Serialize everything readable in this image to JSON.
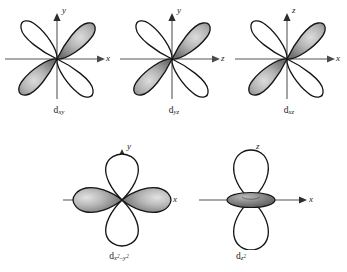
{
  "figure": {
    "background_color": "#ffffff",
    "axis_color": "#8a8a8a",
    "outline_color": "#1a1a1a",
    "lobe_shaded_color": "#9a9a9a",
    "lobe_white_color": "#ffffff",
    "row1": [
      {
        "id": "dxy",
        "label_d": "d",
        "label_sub": "xy",
        "vertical_axis": "y",
        "horizontal_axis": "x",
        "shaded_quadrants": [
          1,
          3
        ],
        "white_quadrants": [
          2,
          4
        ],
        "shape": "four-lobe-diagonal"
      },
      {
        "id": "dyz",
        "label_d": "d",
        "label_sub": "yz",
        "vertical_axis": "y",
        "horizontal_axis": "z",
        "shaded_quadrants": [
          1,
          3
        ],
        "white_quadrants": [
          2,
          4
        ],
        "shape": "four-lobe-diagonal"
      },
      {
        "id": "dxz",
        "label_d": "d",
        "label_sub": "xz",
        "vertical_axis": "z",
        "horizontal_axis": "x",
        "shaded_quadrants": [
          1,
          3
        ],
        "white_quadrants": [
          2,
          4
        ],
        "shape": "four-lobe-diagonal"
      }
    ],
    "row2": [
      {
        "id": "dx2-y2",
        "label_d": "d",
        "label_sub_main": "x",
        "label_sub_sup1": "2",
        "label_sub_minus": "–y",
        "label_sub_sup2": "2",
        "vertical_axis": "y",
        "horizontal_axis": "x",
        "shaded_axis": "x",
        "white_axis": "y",
        "shape": "four-lobe-axial"
      },
      {
        "id": "dz2",
        "label_d": "d",
        "label_sub_main": "z",
        "label_sub_sup1": "2",
        "vertical_axis": "z",
        "horizontal_axis": "x",
        "shaded_element": "torus",
        "white_axis": "z",
        "shape": "two-lobe-with-torus"
      }
    ]
  }
}
